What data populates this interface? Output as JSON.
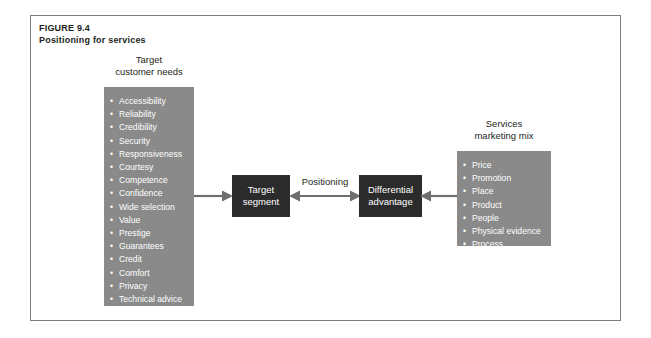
{
  "figure": {
    "number_label": "FIGURE 9.4",
    "title": "Positioning for services"
  },
  "colors": {
    "panel_grey": "#8a8a8a",
    "box_dark": "#2b2b2b",
    "frame_border": "#7d7f82",
    "arrow": "#6e6e6e",
    "text_dark": "#231f20",
    "text_light": "#ffffff"
  },
  "customer_needs": {
    "heading_line1": "Target",
    "heading_line2": "customer needs",
    "items": [
      "Accessibility",
      "Reliability",
      "Credibility",
      "Security",
      "Responsiveness",
      "Courtesy",
      "Competence",
      "Confidence",
      "Wide selection",
      "Value",
      "Prestige",
      "Guarantees",
      "Credit",
      "Comfort",
      "Privacy",
      "Technical advice",
      "Speed"
    ]
  },
  "marketing_mix": {
    "heading_line1": "Services",
    "heading_line2": "marketing mix",
    "items": [
      "Price",
      "Promotion",
      "Place",
      "Product",
      "People",
      "Physical evidence",
      "Process"
    ]
  },
  "center": {
    "target_segment_line1": "Target",
    "target_segment_line2": "segment",
    "differential_line1": "Differential",
    "differential_line2": "advantage",
    "positioning_label": "Positioning"
  },
  "arrows": {
    "needs_to_target": "arrow-right",
    "positioning": "arrow-double-horizontal",
    "mix_to_differential": "arrow-left"
  }
}
